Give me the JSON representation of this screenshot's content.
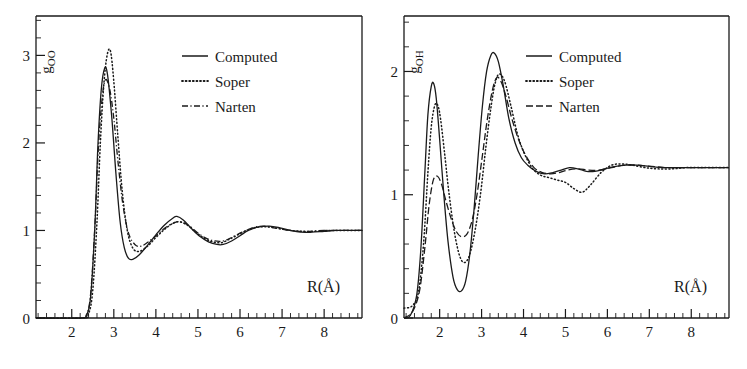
{
  "figure": {
    "background": "#ffffff",
    "ink": "#1a1a1a",
    "panel_count": 2
  },
  "panels": [
    {
      "id": "left",
      "name": "g-oo-panel",
      "ylabel": "g",
      "ylabel_sub": "OO",
      "xlabel": "R(Å)",
      "xticks": [
        "2",
        "3",
        "4",
        "5",
        "6",
        "7",
        "8"
      ],
      "yticks": [
        "0",
        "1",
        "2",
        "3"
      ],
      "legend": [
        {
          "label": "Computed",
          "style": "solid"
        },
        {
          "label": "Soper",
          "style": "dotted"
        },
        {
          "label": "Narten",
          "style": "dashdot"
        }
      ]
    },
    {
      "id": "right",
      "name": "g-oh-panel",
      "ylabel": "g",
      "ylabel_sub": "OH",
      "xlabel": "R(Å)",
      "xticks": [
        "2",
        "3",
        "4",
        "5",
        "6",
        "7",
        "8"
      ],
      "yticks": [
        "0",
        "1",
        "2"
      ],
      "legend": [
        {
          "label": "Computed",
          "style": "solid"
        },
        {
          "label": "Soper",
          "style": "dotted"
        },
        {
          "label": "Narten",
          "style": "dashed"
        }
      ]
    }
  ],
  "chart_data": [
    {
      "type": "line",
      "title": "",
      "xlabel": "R(Å)",
      "ylabel": "g_OO",
      "xlim": [
        1.15,
        8.9
      ],
      "ylim": [
        0,
        3.45
      ],
      "grid": false,
      "legend_position": "top-right",
      "series": [
        {
          "name": "Computed",
          "style": "solid",
          "x": [
            1.15,
            2.2,
            2.35,
            2.45,
            2.55,
            2.62,
            2.7,
            2.78,
            2.85,
            2.95,
            3.05,
            3.15,
            3.25,
            3.35,
            3.45,
            3.6,
            3.8,
            4.0,
            4.2,
            4.4,
            4.5,
            4.65,
            4.85,
            5.05,
            5.25,
            5.45,
            5.6,
            5.8,
            6.0,
            6.2,
            6.45,
            6.7,
            6.95,
            7.2,
            7.45,
            7.7,
            8.0,
            8.3,
            8.6,
            8.9
          ],
          "y": [
            0.0,
            0.0,
            0.03,
            0.25,
            1.05,
            1.95,
            2.6,
            2.85,
            2.78,
            2.3,
            1.65,
            1.1,
            0.8,
            0.68,
            0.67,
            0.72,
            0.83,
            0.95,
            1.06,
            1.14,
            1.16,
            1.12,
            1.02,
            0.93,
            0.87,
            0.84,
            0.84,
            0.88,
            0.94,
            1.0,
            1.04,
            1.05,
            1.03,
            1.0,
            0.98,
            0.98,
            0.99,
            1.0,
            1.0,
            1.0
          ]
        },
        {
          "name": "Soper",
          "style": "dotted",
          "x": [
            1.15,
            2.25,
            2.4,
            2.5,
            2.6,
            2.68,
            2.76,
            2.84,
            2.92,
            3.0,
            3.1,
            3.2,
            3.32,
            3.45,
            3.6,
            3.8,
            4.0,
            4.2,
            4.4,
            4.55,
            4.75,
            4.95,
            5.15,
            5.35,
            5.55,
            5.75,
            5.95,
            6.2,
            6.45,
            6.7,
            6.95,
            7.2,
            7.5,
            7.8,
            8.1,
            8.45,
            8.9
          ],
          "y": [
            0.0,
            0.0,
            0.05,
            0.32,
            1.1,
            2.0,
            2.65,
            3.0,
            3.05,
            2.7,
            2.05,
            1.45,
            1.0,
            0.8,
            0.76,
            0.82,
            0.92,
            1.01,
            1.08,
            1.1,
            1.06,
            0.98,
            0.91,
            0.87,
            0.86,
            0.9,
            0.95,
            1.01,
            1.04,
            1.04,
            1.02,
            1.0,
            0.99,
            0.99,
            1.0,
            1.0,
            1.0
          ]
        },
        {
          "name": "Narten",
          "style": "dashdot",
          "x": [
            1.15,
            2.2,
            2.35,
            2.45,
            2.55,
            2.63,
            2.72,
            2.8,
            2.9,
            3.0,
            3.1,
            3.22,
            3.35,
            3.5,
            3.65,
            3.85,
            4.05,
            4.25,
            4.45,
            4.6,
            4.8,
            5.0,
            5.2,
            5.4,
            5.6,
            5.8,
            6.05,
            6.3,
            6.55,
            6.8,
            7.05,
            7.35,
            7.65,
            8.0,
            8.4,
            8.9
          ],
          "y": [
            0.0,
            0.0,
            0.04,
            0.28,
            1.05,
            1.92,
            2.5,
            2.72,
            2.62,
            2.28,
            1.78,
            1.28,
            0.97,
            0.84,
            0.82,
            0.88,
            0.96,
            1.04,
            1.09,
            1.1,
            1.05,
            0.97,
            0.91,
            0.88,
            0.88,
            0.92,
            0.98,
            1.03,
            1.05,
            1.03,
            1.01,
            0.99,
            0.99,
            1.0,
            1.0,
            1.0
          ]
        }
      ]
    },
    {
      "type": "line",
      "title": "",
      "xlabel": "R(Å)",
      "ylabel": "g_OH",
      "xlim": [
        1.15,
        8.9
      ],
      "ylim": [
        0,
        2.45
      ],
      "grid": false,
      "legend_position": "top-right",
      "series": [
        {
          "name": "Computed",
          "style": "solid",
          "x": [
            1.15,
            1.3,
            1.45,
            1.55,
            1.65,
            1.72,
            1.8,
            1.86,
            1.92,
            2.0,
            2.1,
            2.2,
            2.32,
            2.42,
            2.52,
            2.62,
            2.72,
            2.82,
            2.92,
            3.02,
            3.12,
            3.22,
            3.3,
            3.4,
            3.52,
            3.65,
            3.8,
            3.95,
            4.1,
            4.3,
            4.5,
            4.7,
            4.9,
            5.1,
            5.3,
            5.5,
            5.7,
            5.95,
            6.2,
            6.45,
            6.7,
            7.0,
            7.3,
            7.6,
            7.95,
            8.3,
            8.65,
            8.9
          ],
          "y": [
            0.0,
            0.02,
            0.18,
            0.55,
            1.2,
            1.65,
            1.88,
            1.9,
            1.78,
            1.45,
            1.0,
            0.62,
            0.33,
            0.23,
            0.22,
            0.3,
            0.52,
            0.88,
            1.32,
            1.72,
            2.0,
            2.13,
            2.15,
            2.08,
            1.88,
            1.62,
            1.42,
            1.3,
            1.24,
            1.19,
            1.17,
            1.18,
            1.2,
            1.22,
            1.21,
            1.19,
            1.19,
            1.21,
            1.23,
            1.24,
            1.24,
            1.23,
            1.22,
            1.22,
            1.22,
            1.22,
            1.22,
            1.22
          ]
        },
        {
          "name": "Soper",
          "style": "dotted",
          "x": [
            1.15,
            1.35,
            1.5,
            1.62,
            1.72,
            1.8,
            1.88,
            1.95,
            2.02,
            2.12,
            2.22,
            2.35,
            2.48,
            2.6,
            2.72,
            2.85,
            2.98,
            3.1,
            3.22,
            3.32,
            3.42,
            3.55,
            3.7,
            3.85,
            4.0,
            4.2,
            4.4,
            4.6,
            4.8,
            5.0,
            5.2,
            5.4,
            5.6,
            5.85,
            6.1,
            6.35,
            6.6,
            6.9,
            7.2,
            7.55,
            7.9,
            8.3,
            8.7,
            8.9
          ],
          "y": [
            0.08,
            0.1,
            0.22,
            0.62,
            1.18,
            1.55,
            1.72,
            1.73,
            1.62,
            1.33,
            1.02,
            0.7,
            0.5,
            0.45,
            0.52,
            0.72,
            1.02,
            1.38,
            1.7,
            1.9,
            1.98,
            1.92,
            1.72,
            1.5,
            1.35,
            1.22,
            1.16,
            1.14,
            1.12,
            1.1,
            1.05,
            1.02,
            1.08,
            1.18,
            1.24,
            1.25,
            1.24,
            1.22,
            1.21,
            1.21,
            1.22,
            1.22,
            1.22,
            1.22
          ]
        },
        {
          "name": "Narten",
          "style": "dashed",
          "x": [
            1.15,
            1.35,
            1.52,
            1.65,
            1.75,
            1.85,
            1.95,
            2.05,
            2.15,
            2.28,
            2.4,
            2.52,
            2.65,
            2.78,
            2.9,
            3.02,
            3.14,
            3.26,
            3.36,
            3.46,
            3.58,
            3.72,
            3.88,
            4.05,
            4.25,
            4.45,
            4.65,
            4.85,
            5.05,
            5.3,
            5.55,
            5.8,
            6.1,
            6.4,
            6.7,
            7.05,
            7.4,
            7.8,
            8.2,
            8.6,
            8.9
          ],
          "y": [
            0.0,
            0.05,
            0.22,
            0.58,
            0.92,
            1.12,
            1.15,
            1.08,
            0.95,
            0.8,
            0.7,
            0.66,
            0.68,
            0.8,
            1.02,
            1.32,
            1.62,
            1.85,
            1.95,
            1.92,
            1.8,
            1.62,
            1.45,
            1.32,
            1.22,
            1.18,
            1.17,
            1.18,
            1.2,
            1.21,
            1.2,
            1.2,
            1.22,
            1.24,
            1.24,
            1.23,
            1.22,
            1.22,
            1.22,
            1.22,
            1.22
          ]
        }
      ]
    }
  ]
}
